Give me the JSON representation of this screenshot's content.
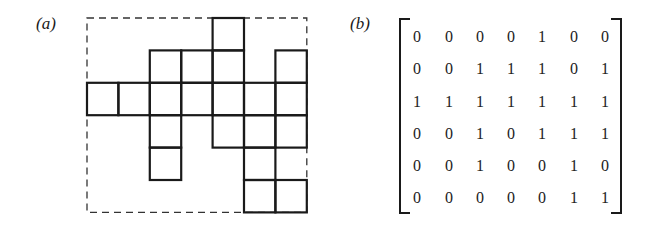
{
  "panel_a": {
    "label": "(a)",
    "grid": {
      "rows": 6,
      "cols": 7,
      "origin_x": 87,
      "origin_y": 18,
      "cell_w": 31.4,
      "cell_h": 32.4
    }
  },
  "panel_b": {
    "label": "(b)",
    "matrix": [
      [
        0,
        0,
        0,
        0,
        1,
        0,
        0
      ],
      [
        0,
        0,
        1,
        1,
        1,
        0,
        1
      ],
      [
        1,
        1,
        1,
        1,
        1,
        1,
        1
      ],
      [
        0,
        0,
        1,
        0,
        1,
        1,
        1
      ],
      [
        0,
        0,
        1,
        0,
        0,
        1,
        0
      ],
      [
        0,
        0,
        0,
        0,
        0,
        1,
        1
      ]
    ]
  }
}
